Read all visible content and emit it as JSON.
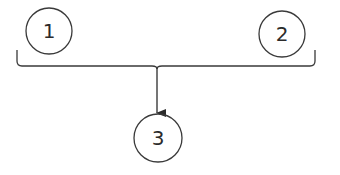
{
  "diagram": {
    "type": "merge-flow",
    "stroke_color": "#3a3a3a",
    "background": "#ffffff",
    "nodes": [
      {
        "id": "n1",
        "label": "1",
        "cx": 49,
        "cy": 31,
        "r": 23
      },
      {
        "id": "n2",
        "label": "2",
        "cx": 282,
        "cy": 34,
        "r": 23
      },
      {
        "id": "n3",
        "label": "3",
        "cx": 158,
        "cy": 138,
        "r": 24
      }
    ],
    "bracket": {
      "left_x": 17,
      "right_x": 315,
      "top_y": 50,
      "bar_y": 66,
      "cusp_x": 157
    },
    "arrow": {
      "from": "bracket",
      "to": "n3",
      "x": 157,
      "y1": 67,
      "y2": 114
    }
  }
}
